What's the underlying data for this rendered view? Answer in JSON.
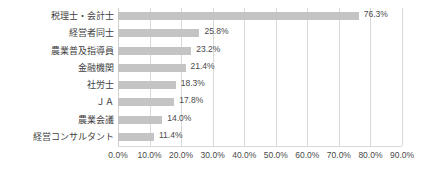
{
  "chart_data": {
    "type": "bar",
    "orientation": "horizontal",
    "title": "",
    "subtitle": "",
    "xlabel": "",
    "ylabel": "",
    "xlim": [
      0,
      90
    ],
    "grid": true,
    "legend": false,
    "legend_position": "none",
    "bar_color": "#c4c4c4",
    "gridline_color": "#d9d9d9",
    "text_color": "#4a4a4a",
    "categories": [
      "税理士・会計士",
      "経営者同士",
      "農業普及指導員",
      "金融機関",
      "社労士",
      "ＪＡ",
      "農業会議",
      "経営コンサルタント"
    ],
    "values": [
      76.3,
      25.8,
      23.2,
      21.4,
      18.3,
      17.8,
      14.0,
      11.4
    ],
    "value_labels": [
      "76.3%",
      "25.8%",
      "23.2%",
      "21.4%",
      "18.3%",
      "17.8%",
      "14.0%",
      "11.4%"
    ],
    "xticks": [
      0,
      10,
      20,
      30,
      40,
      50,
      60,
      70,
      80,
      90
    ],
    "xtick_labels": [
      "0.0%",
      "10.0%",
      "20.0%",
      "30.0%",
      "40.0%",
      "50.0%",
      "60.0%",
      "70.0%",
      "80.0%",
      "90.0%"
    ]
  }
}
